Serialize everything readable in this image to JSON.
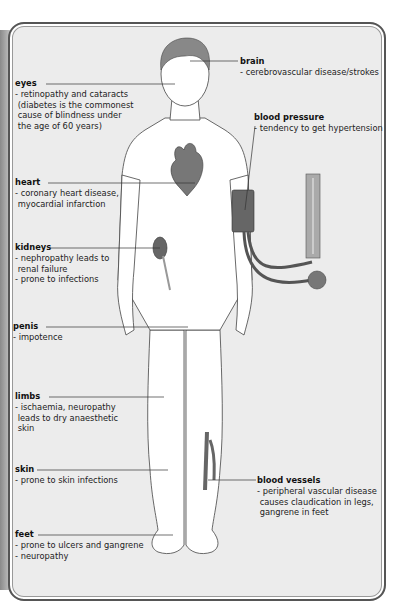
{
  "diagram": {
    "type": "anatomical-annotation",
    "labels": [
      {
        "id": "eyes",
        "title": "eyes",
        "desc": "- retinopathy and cataracts\n (diabetes is the commonest\n cause of blindness under\n the age of 60 years)"
      },
      {
        "id": "brain",
        "title": "brain",
        "desc": "- cerebrovascular disease/strokes"
      },
      {
        "id": "blood-pressure",
        "title": "blood pressure",
        "desc": "- tendency to get hypertension"
      },
      {
        "id": "heart",
        "title": "heart",
        "desc": "- coronary heart disease,\n myocardial infarction"
      },
      {
        "id": "kidneys",
        "title": "kidneys",
        "desc": "- nephropathy leads to\n renal failure\n- prone to infections"
      },
      {
        "id": "penis",
        "title": "penis",
        "desc": "- impotence"
      },
      {
        "id": "limbs",
        "title": "limbs",
        "desc": "- ischaemia, neuropathy\n leads to dry anaesthetic\n skin"
      },
      {
        "id": "skin",
        "title": "skin",
        "desc": "- prone to skin infections"
      },
      {
        "id": "blood-vessels",
        "title": "blood vessels",
        "desc": "- peripheral vascular disease\n causes claudication in legs,\n gangrene in feet"
      },
      {
        "id": "feet",
        "title": "feet",
        "desc": "- prone to ulcers and gangrene\n- neuropathy"
      }
    ],
    "colors": {
      "panel": "#ececec",
      "border": "#555555",
      "organ": "#6b6b6b",
      "body": "#ffffff",
      "line": "#333333"
    }
  }
}
